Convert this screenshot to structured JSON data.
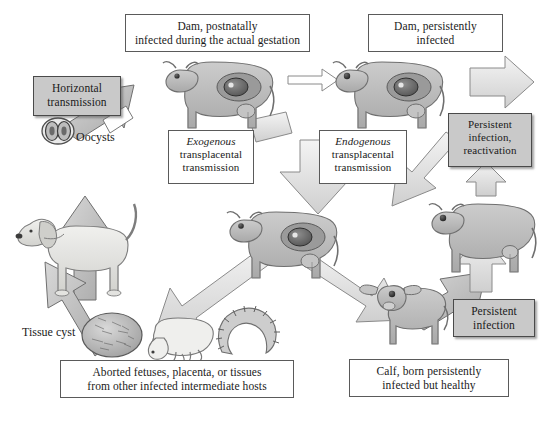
{
  "diagram": {
    "background_color": "#ffffff",
    "shaded_box_color": "#c9c9c9",
    "animal_fill_color": "#bdbdbd",
    "arrow_fill_color": "#d6d6d6",
    "outline_color": "#555555"
  },
  "labels": {
    "dam_postnatal": {
      "line1": "Dam, postnatally",
      "line2": "infected during the actual gestation",
      "style": "plain-box"
    },
    "dam_persistent": {
      "line1": "Dam, persistently",
      "line2": "infected",
      "style": "plain-box"
    },
    "horizontal_transmission": {
      "line1": "Horizontal",
      "line2": "transmission",
      "style": "shaded-box"
    },
    "exogenous": {
      "line1": "Exogenous",
      "line2": "transplacental",
      "line3": "transmission",
      "style": "plain-box",
      "emphasis": "line1-italic"
    },
    "endogenous": {
      "line1": "Endogenous",
      "line2": "transplacental",
      "line3": "transmission",
      "style": "plain-box",
      "emphasis": "line1-italic"
    },
    "persistent_reactivation": {
      "line1": "Persistent",
      "line2": "infection,",
      "line3": "reactivation",
      "style": "shaded-box"
    },
    "persistent_infection": {
      "line1": "Persistent",
      "line2": "infection",
      "style": "shaded-box"
    },
    "aborted_material": {
      "line1": "Aborted fetuses, placenta, or tissues",
      "line2": "from other infected intermediate hosts",
      "style": "plain-box"
    },
    "calf": {
      "line1": "Calf, born persistently",
      "line2": "infected but healthy",
      "style": "plain-box"
    },
    "oocysts": {
      "text": "Oocysts",
      "style": "plain-text"
    },
    "tissue_cyst": {
      "text": "Tissue cyst",
      "style": "plain-text"
    }
  },
  "figures": [
    {
      "name": "dog-definitive-host",
      "caption": "dog"
    },
    {
      "name": "oocyst-pair",
      "caption": "oocysts"
    },
    {
      "name": "cow-pregnant-postnatally-infected",
      "caption": "cow with fetus"
    },
    {
      "name": "cow-pregnant-persistently-infected",
      "caption": "cow with fetus"
    },
    {
      "name": "cow-pregnant-middle",
      "caption": "cow with fetus"
    },
    {
      "name": "cow-persistently-infected-right",
      "caption": "cow"
    },
    {
      "name": "calf-figure",
      "caption": "calf"
    },
    {
      "name": "tissue-cyst-figure",
      "caption": "tissue cyst"
    },
    {
      "name": "aborted-fetus-figure",
      "caption": "aborted fetus"
    },
    {
      "name": "placenta-figure",
      "caption": "placenta"
    }
  ],
  "arrows": [
    {
      "name": "arrow-oocysts-to-dam",
      "direction": "up-right",
      "style": "thick-shaded"
    },
    {
      "name": "arrow-dam-to-dam-persistent",
      "direction": "right",
      "style": "thin-outline"
    },
    {
      "name": "arrow-dam-persistent-to-reactivation",
      "direction": "down-right",
      "style": "thick-outline"
    },
    {
      "name": "arrow-reactivation-to-cow-right",
      "direction": "down",
      "style": "thick-outline"
    },
    {
      "name": "arrow-endogenous-down",
      "direction": "down",
      "style": "thick-outline"
    },
    {
      "name": "arrow-cow-to-calf",
      "direction": "down-right",
      "style": "thick-outline"
    },
    {
      "name": "arrow-calf-to-persistent-infection",
      "direction": "up-right",
      "style": "thick-shaded"
    },
    {
      "name": "arrow-cow-to-aborted",
      "direction": "down-left",
      "style": "thick-outline"
    },
    {
      "name": "arrow-aborted-to-dog",
      "direction": "up-left",
      "style": "thick-shaded"
    },
    {
      "name": "arrow-dog-to-oocysts",
      "direction": "up",
      "style": "thick-shaded"
    }
  ]
}
